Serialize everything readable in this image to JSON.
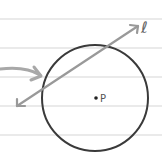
{
  "diagram": {
    "paper_lines_y": [
      19,
      48,
      77,
      106,
      135
    ],
    "circle": {
      "cx": 95,
      "cy": 98,
      "r": 53,
      "stroke": "#3a3a3a"
    },
    "center_point": {
      "label": "P",
      "x": 96,
      "y": 98
    },
    "line": {
      "label": "ℓ",
      "x1": 17,
      "y1": 106,
      "x2": 138,
      "y2": 26,
      "stroke": "#999999"
    },
    "pointer_arrow": {
      "stroke": "#a8a8a8"
    },
    "colors": {
      "paper_line": "#e3e3e3",
      "background": "#ffffff"
    }
  }
}
